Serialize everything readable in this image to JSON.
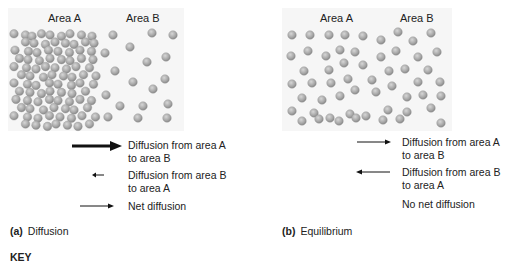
{
  "panel_a": {
    "area_a_label": "Area A",
    "area_b_label": "Area B",
    "legend": [
      {
        "text": "Diffusion from area A to area B",
        "line1": "Diffusion from area A",
        "line2": "to area B",
        "direction": "right",
        "weight": "thick"
      },
      {
        "text": "Diffusion from area B to area A",
        "line1": "Diffusion from area B",
        "line2": "to area A",
        "direction": "left",
        "weight": "short"
      },
      {
        "text": "Net diffusion",
        "line1": "Net diffusion",
        "line2": "",
        "direction": "right",
        "weight": "thin"
      }
    ],
    "caption_letter": "(a)",
    "caption_text": "Diffusion"
  },
  "panel_b": {
    "area_a_label": "Area A",
    "area_b_label": "Area B",
    "legend": [
      {
        "text": "Diffusion from area A to area B",
        "line1": "Diffusion from area A",
        "line2": "to area B",
        "direction": "right",
        "weight": "thin"
      },
      {
        "text": "Diffusion from area B to area A",
        "line1": "Diffusion from area B",
        "line2": "to area A",
        "direction": "left",
        "weight": "thin"
      },
      {
        "text": "No net diffusion",
        "line1": "No net diffusion",
        "line2": "",
        "direction": "none",
        "weight": "none"
      }
    ],
    "caption_letter": "(b)",
    "caption_text": "Equilibrium"
  },
  "key_label": "KEY",
  "colors": {
    "panel_bg": "#f6f6f6",
    "particle": "#a9a9a9",
    "particle_highlight": "#d2d2d2",
    "arrow": "#111111"
  }
}
